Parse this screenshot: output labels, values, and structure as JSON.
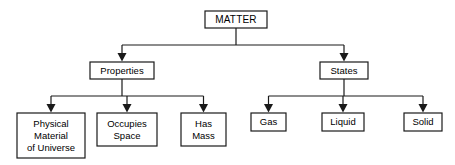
{
  "diagram": {
    "type": "hierarchy-tree",
    "title": "MATTER",
    "root": {
      "label": "MATTER",
      "box": {
        "x": 205,
        "y": 11,
        "w": 62,
        "h": 17
      }
    },
    "level2": [
      {
        "id": "properties",
        "label": "Properties",
        "box": {
          "x": 90,
          "y": 62,
          "w": 64,
          "h": 17
        }
      },
      {
        "id": "states",
        "label": "States",
        "box": {
          "x": 320,
          "y": 62,
          "w": 48,
          "h": 17
        }
      }
    ],
    "level3": [
      {
        "id": "physical-material-of-universe",
        "parent": "properties",
        "lines": [
          "Physical",
          "Material",
          "of Universe"
        ],
        "box": {
          "x": 17,
          "y": 113,
          "w": 68,
          "h": 45
        }
      },
      {
        "id": "occupies-space",
        "parent": "properties",
        "lines": [
          "Occupies",
          "Space"
        ],
        "box": {
          "x": 97,
          "y": 113,
          "w": 60,
          "h": 33
        }
      },
      {
        "id": "has-mass",
        "parent": "properties",
        "lines": [
          "Has",
          "Mass"
        ],
        "box": {
          "x": 181,
          "y": 113,
          "w": 45,
          "h": 33
        }
      },
      {
        "id": "gas",
        "parent": "states",
        "lines": [
          "Gas"
        ],
        "box": {
          "x": 251,
          "y": 113,
          "w": 35,
          "h": 18
        }
      },
      {
        "id": "liquid",
        "parent": "states",
        "lines": [
          "Liquid"
        ],
        "box": {
          "x": 322,
          "y": 113,
          "w": 42,
          "h": 18
        }
      },
      {
        "id": "solid",
        "parent": "states",
        "lines": [
          "Solid"
        ],
        "box": {
          "x": 404,
          "y": 113,
          "w": 38,
          "h": 18
        }
      }
    ],
    "colors": {
      "line": "#1a1a1a",
      "box_fill": "#ffffff",
      "text": "#000000",
      "background": "#ffffff"
    }
  }
}
